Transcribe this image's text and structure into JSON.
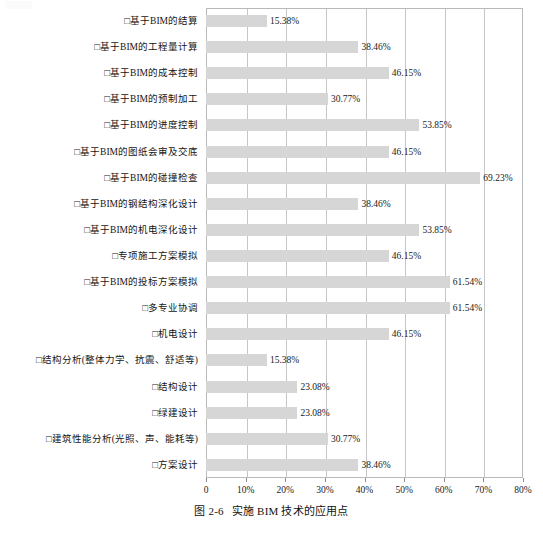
{
  "caption": {
    "number": "图 2-6",
    "text": "实施 BIM 技术的应用点"
  },
  "chart_data": {
    "type": "bar",
    "orientation": "horizontal",
    "title": "实施 BIM 技术的应用点",
    "xlabel": "",
    "ylabel": "",
    "xlim": [
      0,
      80
    ],
    "grid": true,
    "legend": false,
    "xticks": [
      "0",
      "10%",
      "20%",
      "30%",
      "40%",
      "50%",
      "60%",
      "70%",
      "80%"
    ],
    "xtick_values": [
      0,
      10,
      20,
      30,
      40,
      50,
      60,
      70,
      80
    ],
    "bar_color": "#d6d6d6",
    "categories": [
      "□基于BIM的结算",
      "□基于BIM的工程量计算",
      "□基于BIM的成本控制",
      "□基于BIM的预制加工",
      "□基于BIM的进度控制",
      "□基于BIM的图纸会审及交底",
      "□基于BIM的碰撞检查",
      "□基于BIM的钢结构深化设计",
      "□基于BIM的机电深化设计",
      "□专项施工方案模拟",
      "□基于BIM的投标方案模拟",
      "□多专业协调",
      "□机电设计",
      "□结构分析(整体力学、抗震、舒适等)",
      "□结构设计",
      "□绿建设计",
      "□建筑性能分析(光照、声、能耗等)",
      "□方案设计"
    ],
    "values": [
      15.38,
      38.46,
      46.15,
      30.77,
      53.85,
      46.15,
      69.23,
      38.46,
      53.85,
      46.15,
      61.54,
      61.54,
      46.15,
      15.38,
      23.08,
      23.08,
      30.77,
      38.46
    ],
    "value_labels": [
      "15.38%",
      "38.46%",
      "46.15%",
      "30.77%",
      "53.85%",
      "46.15%",
      "69.23%",
      "38.46%",
      "53.85%",
      "46.15%",
      "61.54%",
      "61.54%",
      "46.15%",
      "15.38%",
      "23.08%",
      "23.08%",
      "30.77%",
      "38.46%"
    ]
  }
}
